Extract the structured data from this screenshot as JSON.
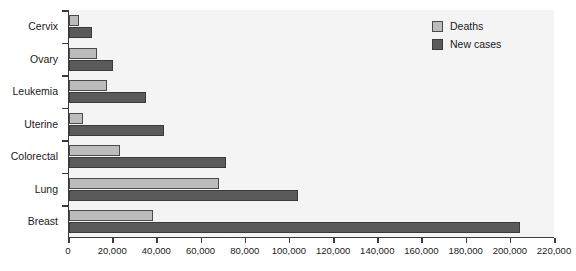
{
  "chart_data": {
    "type": "bar",
    "orientation": "horizontal",
    "title": "",
    "subtitle": "",
    "xlabel": "",
    "ylabel": "",
    "categories": [
      "Cervix",
      "Ovary",
      "Leukemia",
      "Uterine",
      "Colorectal",
      "Lung",
      "Breast"
    ],
    "series": [
      {
        "name": "Deaths",
        "color": "#bcbcbc",
        "values": [
          4500,
          12500,
          17000,
          6500,
          23000,
          68000,
          38000
        ]
      },
      {
        "name": "New cases",
        "color": "#5a5a5a",
        "values": [
          10500,
          20000,
          35000,
          43000,
          71000,
          103500,
          204000
        ]
      }
    ],
    "xlim": [
      0,
      220000
    ],
    "xtick_values": [
      0,
      20000,
      40000,
      60000,
      80000,
      100000,
      120000,
      140000,
      160000,
      180000,
      200000,
      220000
    ],
    "xtick_labels": [
      "0",
      "20,000",
      "40,000",
      "60,000",
      "80,000",
      "100,000",
      "120,000",
      "140,000",
      "160,000",
      "180,000",
      "200,000",
      "220,000"
    ],
    "grid": false,
    "legend_position": "top-right",
    "plot_background": "#f4f4f4",
    "axis_color": "#3b3b3b"
  },
  "legend": {
    "items": [
      {
        "label": "Deaths"
      },
      {
        "label": "New cases"
      }
    ]
  }
}
